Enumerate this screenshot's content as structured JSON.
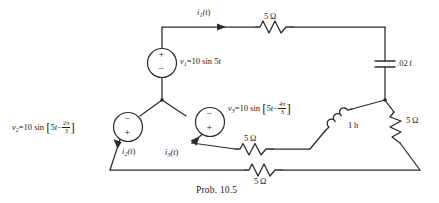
{
  "figure": {
    "caption": "Prob. 10.5",
    "type": "electrical-circuit-schematic"
  },
  "sources": [
    {
      "id": "v1",
      "name_html": "v<sub>1</sub>",
      "expression": "v₁ = 10 sin 5t",
      "amplitude": 10,
      "omega": 5,
      "phase": "0",
      "polarity_top": "+",
      "polarity_bottom": "−",
      "label_parts": {
        "name": "v",
        "sub": "1",
        "eq": "=10 sin 5",
        "var": "t"
      }
    },
    {
      "id": "v2",
      "name_html": "v<sub>2</sub>",
      "expression": "v₂ = 10 sin[5t − 2π/3]",
      "amplitude": 10,
      "omega": 5,
      "phase": "-2π/3",
      "phase_numerator": "2π",
      "phase_denominator": "3",
      "polarity_top": "−",
      "polarity_bottom": "+",
      "label_parts": {
        "name": "v",
        "sub": "2",
        "eq": "=10 sin",
        "inner": "5",
        "var": "t",
        "minus": "−"
      }
    },
    {
      "id": "v3",
      "name_html": "v<sub>3</sub>",
      "expression": "v₃ = 10 sin[5t − 4π/3]",
      "amplitude": 10,
      "omega": 5,
      "phase": "-4π/3",
      "phase_numerator": "4π",
      "phase_denominator": "3",
      "polarity_top": "−",
      "polarity_bottom": "+",
      "label_parts": {
        "name": "v",
        "sub": "3",
        "eq": "=10 sin",
        "inner": "5",
        "var": "t",
        "minus": "−"
      }
    }
  ],
  "currents": [
    {
      "id": "i1",
      "label": "i₁(t)",
      "name": "i",
      "sub": "1",
      "tail": "(t)",
      "location": "top-branch"
    },
    {
      "id": "i2",
      "label": "i₂(t)",
      "name": "i",
      "sub": "2",
      "tail": "(t)",
      "location": "left-lower-branch"
    },
    {
      "id": "i3",
      "label": "i₃(t)",
      "name": "i",
      "sub": "3",
      "tail": "(t)",
      "location": "middle-branch"
    }
  ],
  "components": [
    {
      "id": "r-top",
      "type": "resistor",
      "value": "5",
      "unit": "Ω",
      "label": "5 Ω",
      "position": "top-wire"
    },
    {
      "id": "c-right",
      "type": "capacitor",
      "value": ".02",
      "unit": "f",
      "label": ".02 f",
      "position": "right-vertical"
    },
    {
      "id": "r-right",
      "type": "resistor",
      "value": "5",
      "unit": "Ω",
      "label": "5 Ω",
      "position": "right-diagonal"
    },
    {
      "id": "l-mid",
      "type": "inductor",
      "value": "1",
      "unit": "h",
      "label": "1 h",
      "position": "middle-right-diagonal"
    },
    {
      "id": "r-mid",
      "type": "resistor",
      "value": "5",
      "unit": "Ω",
      "label": "5 Ω",
      "position": "middle-branch"
    },
    {
      "id": "r-bottom",
      "type": "resistor",
      "value": "5",
      "unit": "Ω",
      "label": "5 Ω",
      "position": "bottom-wire"
    }
  ],
  "colors": {
    "ink": "#2b2b2b",
    "text": "#1d1d1d",
    "background": "#ffffff"
  }
}
